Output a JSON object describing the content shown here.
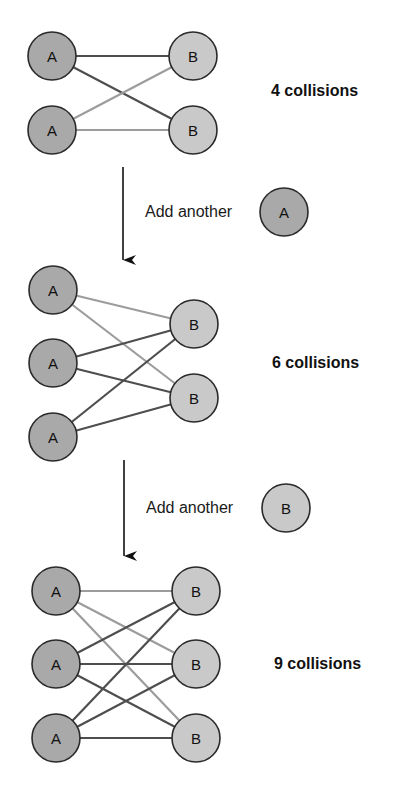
{
  "colors": {
    "node_a_fill": "#a9a9a9",
    "node_b_fill": "#c9c9c9",
    "node_stroke": "#2a2a2a",
    "edge_dark": "#4e4e4e",
    "edge_light": "#9c9c9c",
    "arrow": "#111111"
  },
  "panels": [
    {
      "id": "panel-1",
      "a_nodes": [
        {
          "label": "A",
          "x": 52,
          "y": 56
        },
        {
          "label": "A",
          "x": 52,
          "y": 130
        }
      ],
      "b_nodes": [
        {
          "label": "B",
          "x": 193,
          "y": 56
        },
        {
          "label": "B",
          "x": 193,
          "y": 130
        }
      ],
      "edges": [
        {
          "from": 0,
          "to": 0,
          "tone": "dark"
        },
        {
          "from": 0,
          "to": 1,
          "tone": "dark"
        },
        {
          "from": 1,
          "to": 0,
          "tone": "light"
        },
        {
          "from": 1,
          "to": 1,
          "tone": "light"
        }
      ],
      "collision_label": "4 collisions",
      "label_x": 271,
      "label_y": 96
    },
    {
      "id": "panel-2",
      "a_nodes": [
        {
          "label": "A",
          "x": 53,
          "y": 290
        },
        {
          "label": "A",
          "x": 53,
          "y": 363
        },
        {
          "label": "A",
          "x": 53,
          "y": 437
        }
      ],
      "b_nodes": [
        {
          "label": "B",
          "x": 194,
          "y": 324
        },
        {
          "label": "B",
          "x": 194,
          "y": 398
        }
      ],
      "edges": [
        {
          "from": 0,
          "to": 0,
          "tone": "light"
        },
        {
          "from": 0,
          "to": 1,
          "tone": "light"
        },
        {
          "from": 1,
          "to": 0,
          "tone": "dark"
        },
        {
          "from": 1,
          "to": 1,
          "tone": "dark"
        },
        {
          "from": 2,
          "to": 0,
          "tone": "dark"
        },
        {
          "from": 2,
          "to": 1,
          "tone": "dark"
        }
      ],
      "collision_label": "6 collisions",
      "label_x": 272,
      "label_y": 368
    },
    {
      "id": "panel-3",
      "a_nodes": [
        {
          "label": "A",
          "x": 56,
          "y": 591
        },
        {
          "label": "A",
          "x": 56,
          "y": 664
        },
        {
          "label": "A",
          "x": 56,
          "y": 738
        }
      ],
      "b_nodes": [
        {
          "label": "B",
          "x": 196,
          "y": 591
        },
        {
          "label": "B",
          "x": 196,
          "y": 664
        },
        {
          "label": "B",
          "x": 196,
          "y": 738
        }
      ],
      "edges": [
        {
          "from": 0,
          "to": 0,
          "tone": "light"
        },
        {
          "from": 0,
          "to": 1,
          "tone": "light"
        },
        {
          "from": 0,
          "to": 2,
          "tone": "light"
        },
        {
          "from": 1,
          "to": 0,
          "tone": "dark"
        },
        {
          "from": 1,
          "to": 1,
          "tone": "dark"
        },
        {
          "from": 1,
          "to": 2,
          "tone": "dark"
        },
        {
          "from": 2,
          "to": 0,
          "tone": "dark"
        },
        {
          "from": 2,
          "to": 1,
          "tone": "dark"
        },
        {
          "from": 2,
          "to": 2,
          "tone": "dark"
        }
      ],
      "collision_label": "9 collisions",
      "label_x": 274,
      "label_y": 669
    }
  ],
  "transitions": [
    {
      "id": "transition-1",
      "text": "Add another",
      "node_label": "A",
      "node_type": "a",
      "arrow_x": 123,
      "arrow_y1": 167,
      "arrow_y2": 262,
      "text_x": 145,
      "text_y": 217,
      "node_x": 284,
      "node_y": 212
    },
    {
      "id": "transition-2",
      "text": "Add another",
      "node_label": "B",
      "node_type": "b",
      "arrow_x": 124,
      "arrow_y1": 460,
      "arrow_y2": 558,
      "text_x": 146,
      "text_y": 513,
      "node_x": 286,
      "node_y": 508
    }
  ],
  "node_radius": 24
}
